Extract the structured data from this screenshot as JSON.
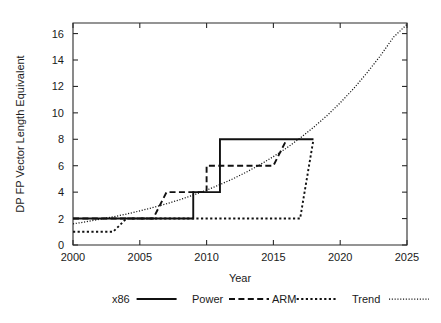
{
  "chart_data": {
    "type": "line",
    "title": "",
    "xlabel": "Year",
    "ylabel": "DP FP Vector Length Equivalent",
    "xlim": [
      2000,
      2025
    ],
    "ylim": [
      0,
      16.8
    ],
    "grid": false,
    "legend_position": "bottom",
    "xticks": [
      2000,
      2005,
      2010,
      2015,
      2020,
      2025
    ],
    "xtick_labels": [
      "2000",
      "2005",
      "2010",
      "2015",
      "2020",
      "2025"
    ],
    "yticks": [
      0,
      2,
      4,
      6,
      8,
      10,
      12,
      14,
      16
    ],
    "ytick_labels": [
      "0",
      "2",
      "4",
      "6",
      "8",
      "10",
      "12",
      "14",
      "16"
    ],
    "series": [
      {
        "name": "x86",
        "style": "solid",
        "points": [
          [
            2000,
            2
          ],
          [
            2009,
            2
          ],
          [
            2009,
            4
          ],
          [
            2010,
            4
          ],
          [
            2010,
            4
          ],
          [
            2011,
            4
          ],
          [
            2011,
            8
          ],
          [
            2012,
            8
          ],
          [
            2018,
            8
          ]
        ]
      },
      {
        "name": "Power",
        "style": "dashed",
        "points": [
          [
            2000,
            2
          ],
          [
            2006,
            2
          ],
          [
            2007,
            4
          ],
          [
            2010,
            4
          ],
          [
            2010,
            6
          ],
          [
            2015,
            6
          ],
          [
            2016,
            8
          ]
        ]
      },
      {
        "name": "ARM",
        "style": "dotted",
        "points": [
          [
            2000,
            1
          ],
          [
            2003,
            1
          ],
          [
            2004,
            2
          ],
          [
            2017,
            2
          ],
          [
            2018,
            8
          ]
        ]
      },
      {
        "name": "Trend",
        "style": "fine-dotted",
        "points": [
          [
            2000,
            1.6
          ],
          [
            2001,
            1.76
          ],
          [
            2002,
            1.94
          ],
          [
            2003,
            2.13
          ],
          [
            2004,
            2.34
          ],
          [
            2005,
            2.58
          ],
          [
            2006,
            2.84
          ],
          [
            2007,
            3.12
          ],
          [
            2008,
            3.43
          ],
          [
            2009,
            3.78
          ],
          [
            2010,
            4.15
          ],
          [
            2011,
            4.57
          ],
          [
            2012,
            5.02
          ],
          [
            2013,
            5.53
          ],
          [
            2014,
            6.08
          ],
          [
            2015,
            6.69
          ],
          [
            2016,
            7.35
          ],
          [
            2017,
            8.09
          ],
          [
            2018,
            8.9
          ],
          [
            2019,
            9.78
          ],
          [
            2020,
            10.76
          ],
          [
            2021,
            11.83
          ],
          [
            2022,
            13.02
          ],
          [
            2023,
            14.31
          ],
          [
            2024,
            15.74
          ],
          [
            2025,
            16.7
          ]
        ]
      }
    ],
    "legend_entries": [
      {
        "label": "x86",
        "style": "solid"
      },
      {
        "label": "Power",
        "style": "dashed"
      },
      {
        "label": "ARM",
        "style": "dotted"
      },
      {
        "label": "Trend",
        "style": "fine-dotted"
      }
    ]
  },
  "colors": {
    "background": "#ffffff",
    "ink": "#111111",
    "axis": "#2b2b2b"
  }
}
